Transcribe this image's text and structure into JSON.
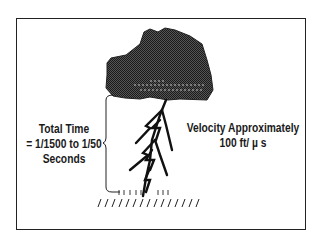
{
  "diagram": {
    "time_label": {
      "line1": "Total Time",
      "line2": "= 1/1500 to 1/50",
      "line3": "Seconds"
    },
    "velocity_label": {
      "line1": "Velocity Approximately",
      "line2": "100 ft/ µ s"
    },
    "colors": {
      "cloud_fill": "#3a3a3a",
      "stroke": "#111111",
      "background": "#ffffff"
    }
  }
}
